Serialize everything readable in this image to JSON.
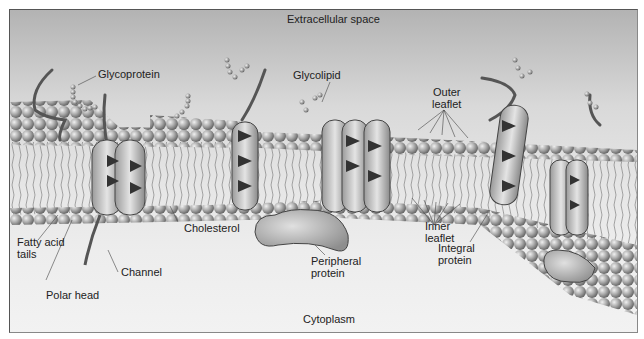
{
  "diagram": {
    "title_top": "Extracellular space",
    "title_bottom": "Cytoplasm",
    "labels": {
      "glycoprotein": "Glycoprotein",
      "glycolipid": "Glycolipid",
      "outer_leaflet_1": "Outer",
      "outer_leaflet_2": "leaflet",
      "inner_leaflet_1": "Inner",
      "inner_leaflet_2": "leaflet",
      "fatty_acid_1": "Fatty acid",
      "fatty_acid_2": "tails",
      "polar_head": "Polar head",
      "channel": "Channel",
      "cholesterol": "Cholesterol",
      "peripheral_1": "Peripheral",
      "peripheral_2": "protein",
      "integral_1": "Integral",
      "integral_2": "protein"
    },
    "colors": {
      "background_top": "#b3b3b3",
      "background_bottom": "#f2f2f2",
      "lipid_head": "#a8a8a8",
      "protein_dark": "#3a3a3a",
      "protein_light": "#d8d8d8",
      "outline": "#444444"
    }
  }
}
